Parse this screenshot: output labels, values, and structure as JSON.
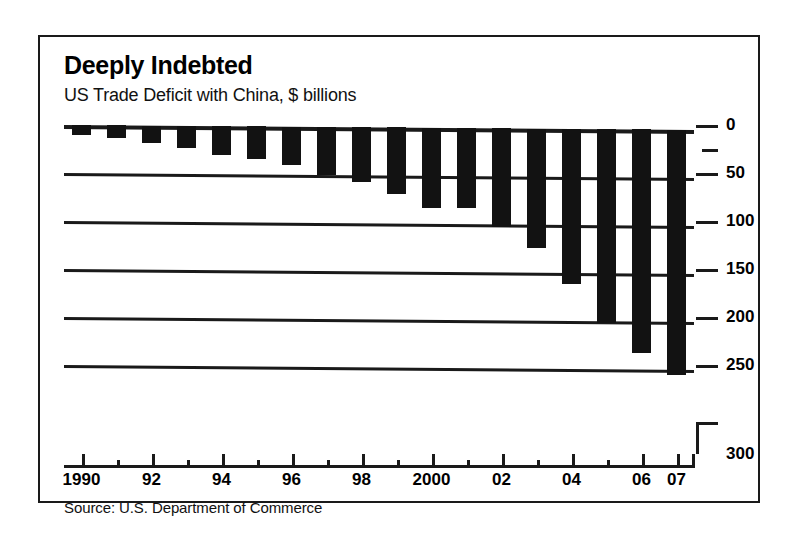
{
  "title": "Deeply Indebted",
  "subtitle": "US Trade Deficit with China, $ billions",
  "source": "Source:  U.S. Department of Commerce",
  "colors": {
    "bar": "#121212",
    "axis": "#1a1a1a",
    "background": "#ffffff",
    "border": "#1a1a1a"
  },
  "chart_data": {
    "type": "bar",
    "title": "Deeply Indebted",
    "subtitle": "US Trade Deficit with China, $ billions",
    "xlabel": "",
    "ylabel": "$ billions",
    "orientation": "downward",
    "note": "Bars hang downward from the zero line; larger deficits extend further down.",
    "ylim": [
      0,
      300
    ],
    "y_inverted": true,
    "yticks": [
      0,
      50,
      100,
      150,
      200,
      250,
      300
    ],
    "ytick_labels": [
      "0",
      "50",
      "100",
      "150",
      "200",
      "250",
      "300"
    ],
    "grid": true,
    "legend": false,
    "categories": [
      "1990",
      "1991",
      "1992",
      "1993",
      "1994",
      "1995",
      "1996",
      "1997",
      "1998",
      "1999",
      "2000",
      "2001",
      "2002",
      "2003",
      "2004",
      "2005",
      "2006",
      "2007"
    ],
    "xtick_labels": [
      "1990",
      "92",
      "94",
      "96",
      "98",
      "2000",
      "02",
      "04",
      "06",
      "07"
    ],
    "xtick_label_years": [
      1990,
      1992,
      1994,
      1996,
      1998,
      2000,
      2002,
      2004,
      2006,
      2007
    ],
    "values": [
      10,
      13,
      18,
      23,
      30,
      34,
      40,
      50,
      57,
      69,
      84,
      83,
      103,
      124,
      162,
      202,
      233,
      256
    ],
    "series": [
      {
        "name": "US Trade Deficit with China",
        "values": [
          10,
          13,
          18,
          23,
          30,
          34,
          40,
          50,
          57,
          69,
          84,
          83,
          103,
          124,
          162,
          202,
          233,
          256
        ]
      }
    ]
  }
}
